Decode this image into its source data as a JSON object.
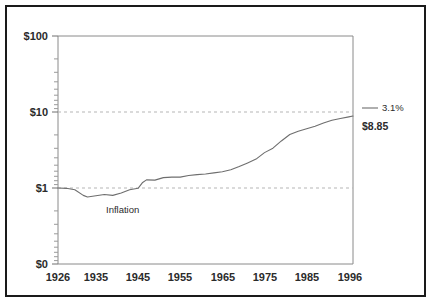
{
  "chart_data": {
    "type": "line",
    "title": "",
    "subtitle": "",
    "xlabel": "",
    "ylabel": "",
    "scale": "log",
    "grid": true,
    "legend_position": "right",
    "xlim": [
      1926,
      1996
    ],
    "ylim": [
      0.1,
      100
    ],
    "x_tick_labels": [
      "1926",
      "1935",
      "1945",
      "1955",
      "1965",
      "1975",
      "1985",
      "1996"
    ],
    "x_ticks": [
      1926,
      1935,
      1945,
      1955,
      1965,
      1975,
      1985,
      1996
    ],
    "y_tick_labels": [
      "$100",
      "$10",
      "$1",
      "$0"
    ],
    "y_ticks": [
      100,
      10,
      1,
      0.1
    ],
    "gridlines_at": [
      10,
      1
    ],
    "series": [
      {
        "name": "Inflation",
        "annotation_label": "Inflation",
        "end_value_label": "$8.85",
        "annualized_return_label": "3.1%",
        "color": "#6e6e6e",
        "x": [
          1926,
          1928,
          1930,
          1932,
          1933,
          1935,
          1937,
          1939,
          1941,
          1943,
          1945,
          1946,
          1947,
          1949,
          1951,
          1953,
          1955,
          1957,
          1959,
          1961,
          1963,
          1965,
          1967,
          1969,
          1971,
          1973,
          1975,
          1977,
          1979,
          1981,
          1983,
          1985,
          1987,
          1989,
          1991,
          1993,
          1995,
          1996
        ],
        "values": [
          1.0,
          0.99,
          0.95,
          0.8,
          0.76,
          0.79,
          0.82,
          0.8,
          0.86,
          0.95,
          0.99,
          1.17,
          1.28,
          1.27,
          1.37,
          1.39,
          1.39,
          1.46,
          1.5,
          1.53,
          1.58,
          1.64,
          1.74,
          1.92,
          2.14,
          2.4,
          2.92,
          3.34,
          4.16,
          5.06,
          5.59,
          6.01,
          6.48,
          7.15,
          7.8,
          8.22,
          8.63,
          8.85
        ]
      }
    ]
  },
  "axis": {
    "y_labels": [
      {
        "text": "$100",
        "value": 100
      },
      {
        "text": "$10",
        "value": 10
      },
      {
        "text": "$1",
        "value": 1
      },
      {
        "text": "$0",
        "value": 0.1
      }
    ],
    "x_labels": [
      {
        "text": "1926",
        "value": 1926
      },
      {
        "text": "1935",
        "value": 1935
      },
      {
        "text": "1945",
        "value": 1945
      },
      {
        "text": "1955",
        "value": 1955
      },
      {
        "text": "1965",
        "value": 1965
      },
      {
        "text": "1975",
        "value": 1975
      },
      {
        "text": "1985",
        "value": 1985
      },
      {
        "text": "1996",
        "value": 1996
      }
    ]
  },
  "annotations": {
    "inflation_label": "Inflation"
  },
  "legend": {
    "percent_label": "3.1%",
    "value_label": "$8.85"
  },
  "colors": {
    "frame": "#1a1a1a",
    "axis": "#8a8a8a",
    "grid": "#b5b5b5",
    "line": "#6e6e6e",
    "text": "#2b2b2b",
    "background": "#ffffff"
  }
}
